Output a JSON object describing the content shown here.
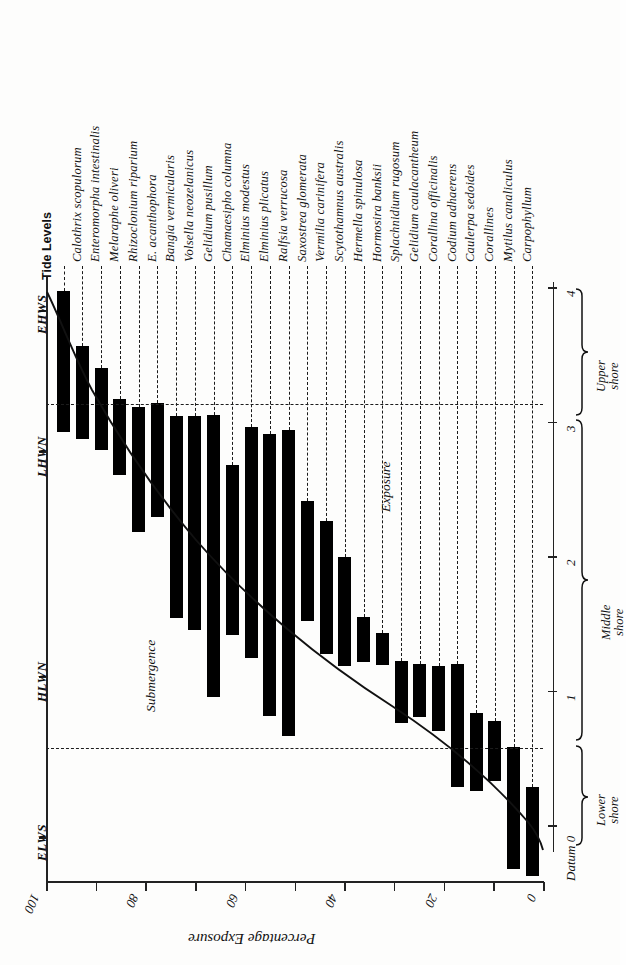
{
  "figure": {
    "tide_levels_header": "Tide Levels",
    "x_axis_title": "Percentage Exposure",
    "annotation_submergence": "Submergence",
    "annotation_exposure": "Exposure",
    "datum_label": "Datum 0",
    "shore_zones": [
      {
        "name": "Lower shore",
        "line1": "Lower",
        "line2": "shore"
      },
      {
        "name": "Middle shore",
        "line1": "Middle shore",
        "line2": ""
      },
      {
        "name": "Upper shore",
        "line1": "Upper",
        "line2": "shore"
      }
    ]
  },
  "chart_data": {
    "type": "bar",
    "title": "",
    "xlabel": "Percentage Exposure",
    "ylabel": "Tide Levels",
    "grid": true,
    "legend": "none",
    "orientation": "rotated-90",
    "xlim": [
      100,
      0
    ],
    "xticks": [
      100,
      90,
      80,
      70,
      60,
      50,
      40,
      30,
      20,
      10,
      0
    ],
    "xtick_labels": [
      "100",
      "",
      "80",
      "",
      "60",
      "",
      "40",
      "",
      "20",
      "",
      "0"
    ],
    "ylim_metres": [
      -0.45,
      4.15
    ],
    "y_right_ticks": [
      0,
      1,
      2,
      3,
      4
    ],
    "y_right_tick_labels": [
      "Datum 0",
      "1",
      "2",
      "3",
      "4"
    ],
    "tide_levels": [
      {
        "abbr": "EHWS",
        "metres": 3.82
      },
      {
        "abbr": "LHWN",
        "metres": 2.83
      },
      {
        "abbr": "HLWN",
        "metres": 1.25
      },
      {
        "abbr": "ELWS",
        "metres": 0.12
      }
    ],
    "gridlines_metres": [
      3.12,
      0.57
    ],
    "categories": [
      "Calothrix scopulorum",
      "Enteromorpha intestinalis",
      "Melaraphe oliveri",
      "Rhizoclonium riparium",
      "E. acanthophora",
      "Bangia vermicularis",
      "Volsella neozelanicus",
      "Gelidium pusillum",
      "Chamaesipho columna",
      "Elminius modestus",
      "Elminius plicatus",
      "Ralfsia verrucosa",
      "Saxostrea glomerata",
      "Vermilia carinifera",
      "Scytothamnus australis",
      "Hermella spinulosa",
      "Hormosira banksii",
      "Splachnidium rugosum",
      "Gelidium caulacantheum",
      "Corallina officinalis",
      "Codium adhaerens",
      "Caulerpa sedoides",
      "Corallines",
      "Mytilus canaliculus",
      "Carpophyllum"
    ],
    "bars_metres": [
      {
        "species": "Calothrix scopulorum",
        "top": 3.97,
        "bottom": 2.92
      },
      {
        "species": "Enteromorpha intestinalis",
        "top": 3.56,
        "bottom": 2.87
      },
      {
        "species": "Melaraphe oliveri",
        "top": 3.4,
        "bottom": 2.79
      },
      {
        "species": "Rhizoclonium riparium",
        "top": 3.17,
        "bottom": 2.6
      },
      {
        "species": "E. acanthophora",
        "top": 3.11,
        "bottom": 2.18
      },
      {
        "species": "Bangia vermicularis",
        "top": 3.14,
        "bottom": 2.29
      },
      {
        "species": "Volsella neozelanicus",
        "top": 3.04,
        "bottom": 1.54
      },
      {
        "species": "Gelidium pusillum",
        "top": 3.04,
        "bottom": 1.45
      },
      {
        "species": "Chamaesipho columna",
        "top": 3.05,
        "bottom": 0.95
      },
      {
        "species": "Elminius modestus",
        "top": 2.68,
        "bottom": 1.41
      },
      {
        "species": "Elminius plicatus",
        "top": 2.96,
        "bottom": 1.24
      },
      {
        "species": "Ralfsia verrucosa",
        "top": 2.91,
        "bottom": 0.81
      },
      {
        "species": "Saxostrea glomerata",
        "top": 2.94,
        "bottom": 0.66
      },
      {
        "species": "Vermilia carinifera",
        "top": 2.41,
        "bottom": 1.52
      },
      {
        "species": "Scytothamnus australis",
        "top": 2.26,
        "bottom": 1.27
      },
      {
        "species": "Hermella spinulosa",
        "top": 1.99,
        "bottom": 1.18
      },
      {
        "species": "Hormosira banksii",
        "top": 1.55,
        "bottom": 1.21
      },
      {
        "species": "Splachnidium rugosum",
        "top": 1.43,
        "bottom": 1.19
      },
      {
        "species": "Gelidium caulacantheum",
        "top": 1.22,
        "bottom": 0.76
      },
      {
        "species": "Corallina officinalis",
        "top": 1.2,
        "bottom": 0.8
      },
      {
        "species": "Codium adhaerens",
        "top": 1.18,
        "bottom": 0.7
      },
      {
        "species": "Caulerpa sedoides",
        "top": 1.2,
        "bottom": 0.28
      },
      {
        "species": "Corallines",
        "top": 0.83,
        "bottom": 0.25
      },
      {
        "species": "Mytilus canaliculus",
        "top": 0.77,
        "bottom": 0.33
      },
      {
        "species": "Carpophyllum",
        "top": 0.58,
        "bottom": -0.33
      },
      {
        "species": "unlabelled",
        "top": 0.28,
        "bottom": -0.38
      }
    ],
    "exposure_curve_note": "monotonic exposure/submergence curve descending from ~3.8 m at 100% exposure to ~0 m at 0% exposure"
  }
}
